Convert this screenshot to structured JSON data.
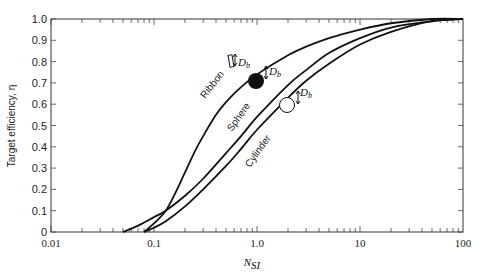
{
  "chart_data": {
    "type": "line",
    "title": "",
    "xlabel": "N_SI",
    "xlabel_main": "N",
    "xlabel_sub": "SI",
    "ylabel": "Target efficiency, η",
    "xscale": "log",
    "xlim": [
      0.01,
      100
    ],
    "ylim": [
      0,
      1.0
    ],
    "grid": false,
    "x_ticks": [
      "0.01",
      "0.1",
      "1.0",
      "10",
      "100"
    ],
    "y_ticks": [
      "0",
      "0.1",
      "0.2",
      "0.3",
      "0.4",
      "0.5",
      "0.6",
      "0.7",
      "0.8",
      "0.9",
      "1.0"
    ],
    "series": [
      {
        "name": "Ribbon",
        "x": [
          0.08,
          0.1,
          0.13,
          0.16,
          0.2,
          0.25,
          0.3,
          0.4,
          0.5,
          0.7,
          1.0,
          2.0,
          3.0,
          5.0,
          10,
          20,
          50,
          100
        ],
        "y": [
          0.0,
          0.04,
          0.1,
          0.18,
          0.28,
          0.38,
          0.45,
          0.55,
          0.61,
          0.68,
          0.74,
          0.83,
          0.87,
          0.91,
          0.95,
          0.98,
          1.0,
          1.0
        ]
      },
      {
        "name": "Sphere",
        "x": [
          0.05,
          0.07,
          0.1,
          0.13,
          0.2,
          0.3,
          0.5,
          0.7,
          1.0,
          2.0,
          3.0,
          5.0,
          10,
          20,
          50,
          100
        ],
        "y": [
          0.0,
          0.03,
          0.07,
          0.1,
          0.17,
          0.25,
          0.37,
          0.45,
          0.54,
          0.69,
          0.76,
          0.84,
          0.91,
          0.96,
          0.99,
          1.0
        ]
      },
      {
        "name": "Cylinder",
        "x": [
          0.08,
          0.1,
          0.13,
          0.2,
          0.3,
          0.5,
          0.7,
          1.0,
          2.0,
          3.0,
          5.0,
          10,
          20,
          50,
          100
        ],
        "y": [
          0.0,
          0.02,
          0.05,
          0.12,
          0.2,
          0.31,
          0.39,
          0.48,
          0.63,
          0.71,
          0.79,
          0.88,
          0.94,
          0.99,
          1.0
        ]
      }
    ],
    "annotations": [
      {
        "text": "Ribbon",
        "label": "D_b"
      },
      {
        "text": "Sphere",
        "label": "D_b"
      },
      {
        "text": "Cylinder",
        "label": "D_b"
      }
    ]
  },
  "labels": {
    "db_main": "D",
    "db_sub": "b",
    "ribbon": "Ribbon",
    "sphere": "Sphere",
    "cylinder": "Cylinder"
  }
}
